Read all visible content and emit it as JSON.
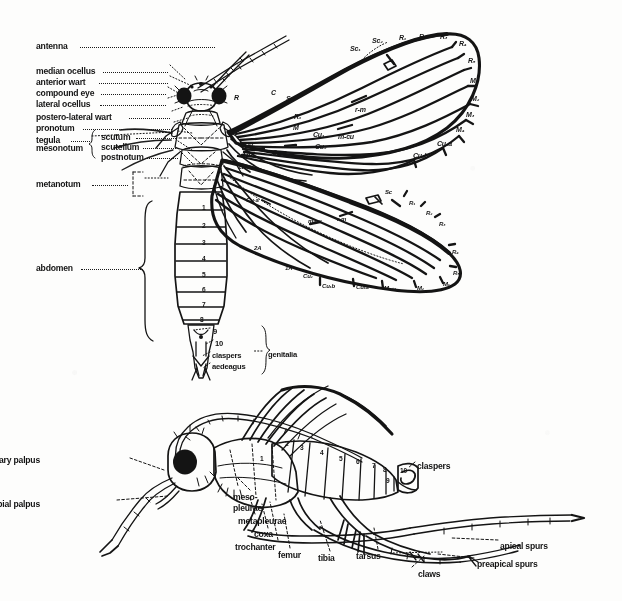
{
  "figure": {
    "domain": "scientific-illustration",
    "background_color": "#fdfdfc",
    "ink_color": "#141414",
    "views": [
      {
        "name": "dorsal-view",
        "description": "Dorsal view of adult with wings spread showing venation, thoracic sclerites and abdominal segments"
      },
      {
        "name": "lateral-view",
        "description": "Lateral view of adult showing head appendages, pleural regions and leg segments"
      }
    ]
  },
  "dorsal": {
    "left_labels": [
      {
        "id": "antenna",
        "text": "antenna",
        "x": 36,
        "y": 42,
        "dot_from": 80,
        "dot_to": 215
      },
      {
        "id": "median-ocellus",
        "text": "median ocellus",
        "x": 36,
        "y": 67,
        "dot_from": 103,
        "dot_to": 168
      },
      {
        "id": "anterior-wart",
        "text": "anterior wart",
        "x": 36,
        "y": 78,
        "dot_from": 99,
        "dot_to": 168
      },
      {
        "id": "compound-eye",
        "text": "compound eye",
        "x": 36,
        "y": 89,
        "dot_from": 101,
        "dot_to": 166
      },
      {
        "id": "lateral-ocellus",
        "text": "lateral ocellus",
        "x": 36,
        "y": 100,
        "dot_from": 100,
        "dot_to": 166
      },
      {
        "id": "postero-lateral-wart",
        "text": "postero-lateral wart",
        "x": 36,
        "y": 113,
        "dot_from": 129,
        "dot_to": 170
      },
      {
        "id": "pronotum",
        "text": "pronotum",
        "x": 36,
        "y": 124,
        "dot_from": 83,
        "dot_to": 172
      },
      {
        "id": "tegula",
        "text": "tegula",
        "x": 36,
        "y": 136,
        "dot_from": 71,
        "dot_to": 90
      },
      {
        "id": "scutum",
        "text": "scutum",
        "x": 101,
        "y": 133,
        "dot_from": 136,
        "dot_to": 176
      },
      {
        "id": "mesonotum",
        "text": "mesonotum",
        "x": 36,
        "y": 144,
        "dot_from": 0,
        "dot_to": 0
      },
      {
        "id": "scutellum",
        "text": "scutellum",
        "x": 101,
        "y": 143,
        "dot_from": 143,
        "dot_to": 176
      },
      {
        "id": "postnotum",
        "text": "postnotum",
        "x": 101,
        "y": 153,
        "dot_from": 145,
        "dot_to": 178
      },
      {
        "id": "metanotum",
        "text": "metanotum",
        "x": 36,
        "y": 180,
        "dot_from": 92,
        "dot_to": 128
      },
      {
        "id": "abdomen",
        "text": "abdomen",
        "x": 36,
        "y": 264,
        "dot_from": 81,
        "dot_to": 143
      }
    ],
    "brace_labels": {
      "mesonotum_group": [
        "scutum",
        "scutellum",
        "postnotum"
      ],
      "genitalia_group": [
        "claspers",
        "aedeagus"
      ]
    },
    "genitalia_labels": [
      {
        "id": "seg-9",
        "text": "9",
        "x": 213,
        "y": 328
      },
      {
        "id": "seg-10",
        "text": "10",
        "x": 215,
        "y": 340
      },
      {
        "id": "claspers",
        "text": "claspers",
        "x": 212,
        "y": 352
      },
      {
        "id": "aedeagus",
        "text": "aedeagus",
        "x": 212,
        "y": 363
      },
      {
        "id": "genitalia",
        "text": "genitalia",
        "x": 268,
        "y": 351
      }
    ],
    "abdomen_segments": [
      {
        "n": "1",
        "x": 202,
        "y": 205
      },
      {
        "n": "2",
        "x": 202,
        "y": 223
      },
      {
        "n": "3",
        "x": 202,
        "y": 240
      },
      {
        "n": "4",
        "x": 202,
        "y": 256
      },
      {
        "n": "5",
        "x": 202,
        "y": 272
      },
      {
        "n": "6",
        "x": 202,
        "y": 287
      },
      {
        "n": "7",
        "x": 202,
        "y": 302
      },
      {
        "n": "8",
        "x": 200,
        "y": 317
      }
    ],
    "forewing_veins": [
      {
        "id": "vein-C",
        "text": "C",
        "x": 271,
        "y": 89
      },
      {
        "id": "vein-Sc",
        "text": "Sc",
        "x": 286,
        "y": 95
      },
      {
        "id": "vein-R",
        "text": "R",
        "x": 234,
        "y": 94
      },
      {
        "id": "vein-R1",
        "text": "R₁",
        "x": 294,
        "y": 113
      },
      {
        "id": "vein-M",
        "text": "M",
        "x": 293,
        "y": 124
      },
      {
        "id": "vein-Cu1",
        "text": "Cu₁",
        "x": 313,
        "y": 131
      },
      {
        "id": "vein-Cu2",
        "text": "Cu₂",
        "x": 315,
        "y": 143
      },
      {
        "id": "vein-Cu-a",
        "text": "Cu-a",
        "x": 272,
        "y": 149
      },
      {
        "id": "vein-Cu",
        "text": "Cu",
        "x": 244,
        "y": 142
      },
      {
        "id": "vein-1A",
        "text": "1A",
        "x": 242,
        "y": 151
      },
      {
        "id": "vein-2A",
        "text": "2A",
        "x": 238,
        "y": 163
      },
      {
        "id": "crossvein-m-cu",
        "text": "m-cu",
        "x": 338,
        "y": 133
      },
      {
        "id": "crossvein-r-m",
        "text": "r-m",
        "x": 355,
        "y": 106
      },
      {
        "id": "vein-Sc1",
        "text": "Sc₁",
        "x": 350,
        "y": 45
      },
      {
        "id": "vein-Sc2",
        "text": "Sc₂",
        "x": 372,
        "y": 37
      },
      {
        "id": "vein-R1-ap",
        "text": "R₁",
        "x": 399,
        "y": 34
      },
      {
        "id": "vein-R2-ap",
        "text": "R₂",
        "x": 419,
        "y": 33
      },
      {
        "id": "vein-R3-ap",
        "text": "R₃",
        "x": 440,
        "y": 33
      },
      {
        "id": "vein-R4-ap",
        "text": "R₄",
        "x": 459,
        "y": 40
      },
      {
        "id": "vein-R5-ap",
        "text": "R₅",
        "x": 468,
        "y": 57
      },
      {
        "id": "vein-M1-ap",
        "text": "M₁",
        "x": 470,
        "y": 77
      },
      {
        "id": "vein-M2-ap",
        "text": "M₂",
        "x": 471,
        "y": 95
      },
      {
        "id": "vein-M3-ap",
        "text": "M₃",
        "x": 466,
        "y": 111
      },
      {
        "id": "vein-M4-ap",
        "text": "M₄",
        "x": 456,
        "y": 126
      },
      {
        "id": "vein-Cu1a-ap",
        "text": "Cu₁a",
        "x": 437,
        "y": 140
      },
      {
        "id": "vein-Cu1b-ap",
        "text": "Cu₁b",
        "x": 413,
        "y": 152
      }
    ],
    "hindwing_veins": [
      {
        "id": "h-vein-Cu-a",
        "text": "Cu-a",
        "x": 246,
        "y": 197
      },
      {
        "id": "h-vein-m-cu",
        "text": "m-cu",
        "x": 308,
        "y": 218
      },
      {
        "id": "h-vein-r-m",
        "text": "r-m",
        "x": 337,
        "y": 216
      },
      {
        "id": "h-vein-Sc",
        "text": "Sc",
        "x": 385,
        "y": 189
      },
      {
        "id": "h-vein-R1",
        "text": "R₁",
        "x": 409,
        "y": 200
      },
      {
        "id": "h-vein-R2",
        "text": "R₂",
        "x": 426,
        "y": 210
      },
      {
        "id": "h-vein-R3",
        "text": "R₃",
        "x": 439,
        "y": 221
      },
      {
        "id": "h-vein-R4",
        "text": "R₄",
        "x": 452,
        "y": 249
      },
      {
        "id": "h-vein-R5",
        "text": "R₅",
        "x": 453,
        "y": 270
      },
      {
        "id": "h-vein-M1",
        "text": "M₁",
        "x": 443,
        "y": 281
      },
      {
        "id": "h-vein-M2",
        "text": "M₂",
        "x": 417,
        "y": 285
      },
      {
        "id": "h-vein-M34",
        "text": "M₃₊₄",
        "x": 384,
        "y": 285
      },
      {
        "id": "h-vein-Cu1a",
        "text": "Cu₁a",
        "x": 356,
        "y": 284
      },
      {
        "id": "h-vein-Cu1b",
        "text": "Cu₁b",
        "x": 322,
        "y": 283
      },
      {
        "id": "h-vein-Cu2",
        "text": "Cu₂",
        "x": 303,
        "y": 273
      },
      {
        "id": "h-vein-1A",
        "text": "1A",
        "x": 285,
        "y": 265
      },
      {
        "id": "h-vein-2A",
        "text": "2A",
        "x": 254,
        "y": 245
      }
    ]
  },
  "lateral": {
    "labels": [
      {
        "id": "maxillary-palpus",
        "text": "maxillary palpus",
        "x": 40,
        "y": 456,
        "align": "right"
      },
      {
        "id": "labial-palpus",
        "text": "labial palpus",
        "x": 40,
        "y": 500,
        "align": "right"
      },
      {
        "id": "meso-pleurae-1",
        "text": "meso-",
        "x": 233,
        "y": 493,
        "align": "left"
      },
      {
        "id": "meso-pleurae-2",
        "text": "pleurae",
        "x": 233,
        "y": 504,
        "align": "left"
      },
      {
        "id": "metapleurae",
        "text": "metapleurae",
        "x": 238,
        "y": 517,
        "align": "left"
      },
      {
        "id": "coxa",
        "text": "coxa",
        "x": 254,
        "y": 530,
        "align": "left"
      },
      {
        "id": "trochanter",
        "text": "trochanter",
        "x": 235,
        "y": 543,
        "align": "left"
      },
      {
        "id": "femur",
        "text": "femur",
        "x": 278,
        "y": 551,
        "align": "left"
      },
      {
        "id": "tibia",
        "text": "tibia",
        "x": 318,
        "y": 554,
        "align": "left"
      },
      {
        "id": "tarsus",
        "text": "tarsus",
        "x": 356,
        "y": 552,
        "align": "left"
      },
      {
        "id": "claws",
        "text": "claws",
        "x": 418,
        "y": 570,
        "align": "left"
      },
      {
        "id": "preapical-spurs",
        "text": "preapical spurs",
        "x": 477,
        "y": 560,
        "align": "left"
      },
      {
        "id": "apical-spurs",
        "text": "apical spurs",
        "x": 500,
        "y": 542,
        "align": "left"
      },
      {
        "id": "claspers-lat",
        "text": "claspers",
        "x": 417,
        "y": 462,
        "align": "left"
      }
    ],
    "abdomen_segments": [
      {
        "n": "1",
        "x": 260,
        "y": 456
      },
      {
        "n": "2",
        "x": 285,
        "y": 441
      },
      {
        "n": "3",
        "x": 300,
        "y": 445
      },
      {
        "n": "4",
        "x": 320,
        "y": 450
      },
      {
        "n": "5",
        "x": 339,
        "y": 456
      },
      {
        "n": "6",
        "x": 356,
        "y": 459
      },
      {
        "n": "7",
        "x": 372,
        "y": 463
      },
      {
        "n": "8",
        "x": 383,
        "y": 467
      },
      {
        "n": "9",
        "x": 386,
        "y": 478
      },
      {
        "n": "10",
        "x": 400,
        "y": 468
      }
    ]
  }
}
